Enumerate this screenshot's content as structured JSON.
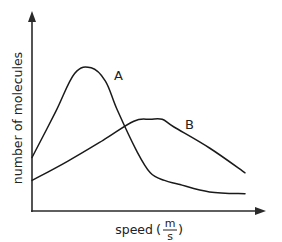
{
  "chart_data": {
    "type": "line",
    "title": "",
    "xlabel": "speed",
    "xlabel_unit": {
      "numerator": "m",
      "denominator": "s"
    },
    "ylabel": "number of molecules",
    "xlim": [
      0,
      10
    ],
    "ylim": [
      0,
      10
    ],
    "grid": false,
    "legend": "none (curves labeled inline)",
    "series": [
      {
        "name": "A",
        "x": [
          0,
          1.0,
          1.8,
          2.5,
          3.1,
          3.6,
          4.4,
          5.0,
          5.6,
          6.2,
          7.5,
          9.0
        ],
        "y": [
          2.8,
          5.2,
          7.2,
          7.5,
          6.8,
          5.3,
          3.2,
          2.0,
          1.6,
          1.4,
          1.0,
          0.9
        ]
      },
      {
        "name": "B",
        "x": [
          0,
          1.5,
          3.0,
          4.3,
          5.0,
          5.5,
          6.0,
          7.5,
          9.0
        ],
        "y": [
          1.6,
          2.6,
          3.7,
          4.7,
          4.8,
          4.8,
          4.4,
          3.3,
          2.0
        ]
      }
    ],
    "annotations": [
      {
        "text": "A",
        "near_series": "A",
        "position": "right of peak"
      },
      {
        "text": "B",
        "near_series": "B",
        "position": "right of peak"
      }
    ]
  }
}
